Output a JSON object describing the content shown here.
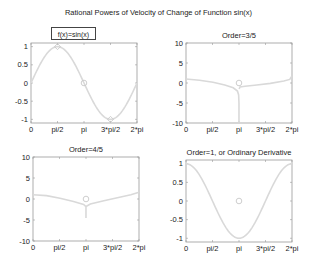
{
  "figure": {
    "title": "Rational Powers of Velocity of Change of Function sin(x)"
  },
  "colors": {
    "curve": "#d9d9d9",
    "marker": "#c8c8c8",
    "axes": "#9a9a9a",
    "text": "#222222"
  },
  "chart_data": [
    {
      "type": "line",
      "title": "f(x)=sin(x)",
      "title_style": "boxed",
      "xlabel": "",
      "ylabel": "",
      "xlim": [
        0,
        6.2832
      ],
      "ylim": [
        -1.1,
        1.1
      ],
      "xticks": [
        0,
        1.5708,
        3.1416,
        4.7124,
        6.2832
      ],
      "xticklabels": [
        "0",
        "pi/2",
        "pi",
        "3*pi/2",
        "2*pi"
      ],
      "yticks": [
        1,
        0.5,
        0,
        -0.5,
        -1
      ],
      "yticklabels": [
        "1",
        "0.5",
        "0",
        "-0.5",
        "-1"
      ],
      "grid": false,
      "series": [
        {
          "name": "sin(x)",
          "function": "sin",
          "x": [
            0,
            0.785,
            1.571,
            2.356,
            3.142,
            3.927,
            4.712,
            5.498,
            6.283
          ],
          "y": [
            0,
            0.707,
            1,
            0.707,
            0,
            -0.707,
            -1,
            -0.707,
            0
          ]
        }
      ],
      "markers": [
        {
          "x": 1.5708,
          "y": 1,
          "shape": "diamond"
        },
        {
          "x": 3.1416,
          "y": 0,
          "shape": "circle"
        },
        {
          "x": 4.7124,
          "y": -1,
          "shape": "diamond"
        }
      ]
    },
    {
      "type": "line",
      "title": "Order=3/5",
      "xlabel": "",
      "ylabel": "",
      "xlim": [
        0,
        6.2832
      ],
      "ylim": [
        -10,
        10
      ],
      "xticks": [
        0,
        1.5708,
        3.1416,
        4.7124,
        6.2832
      ],
      "xticklabels": [
        "0",
        "pi/2",
        "pi",
        "3*pi/2",
        "2*pi"
      ],
      "yticks": [
        10,
        5,
        0,
        -5,
        -10
      ],
      "yticklabels": [
        "10",
        "5",
        "0",
        "-5",
        "-10"
      ],
      "grid": false,
      "series": [
        {
          "name": "left branch",
          "x": [
            0,
            0.8,
            1.6,
            2.3,
            2.8,
            3.05,
            3.12,
            3.14,
            3.14
          ],
          "y": [
            1.0,
            0.7,
            0.2,
            -0.5,
            -1.2,
            -2.0,
            -3.0,
            -5.0,
            -10.0
          ]
        },
        {
          "name": "right branch",
          "x": [
            3.15,
            3.2,
            3.5,
            4.2,
            5.0,
            5.8,
            6.15,
            6.283
          ],
          "y": [
            -1.5,
            -1.0,
            -0.8,
            -0.5,
            -0.1,
            0.5,
            0.9,
            1.8
          ]
        }
      ],
      "markers": [
        {
          "x": 3.1416,
          "y": 0,
          "shape": "circle"
        }
      ]
    },
    {
      "type": "line",
      "title": "Order=4/5",
      "xlabel": "",
      "ylabel": "",
      "xlim": [
        0,
        6.2832
      ],
      "ylim": [
        -10,
        10
      ],
      "xticks": [
        0,
        1.5708,
        3.1416,
        4.7124,
        6.2832
      ],
      "xticklabels": [
        "0",
        "pi/2",
        "pi",
        "3*pi/2",
        "2*pi"
      ],
      "yticks": [
        10,
        5,
        0,
        -5,
        -10
      ],
      "yticklabels": [
        "10",
        "5",
        "0",
        "-5",
        "-10"
      ],
      "grid": false,
      "series": [
        {
          "name": "left branch",
          "x": [
            0,
            0.8,
            1.6,
            2.4,
            3.0,
            3.14,
            3.14
          ],
          "y": [
            1.0,
            0.8,
            0.2,
            -0.6,
            -1.3,
            -1.8,
            -4.5
          ]
        },
        {
          "name": "right branch",
          "x": [
            3.14,
            3.4,
            4.2,
            5.0,
            5.8,
            6.283
          ],
          "y": [
            -1.8,
            -1.2,
            -0.4,
            0.3,
            1.0,
            1.6
          ]
        }
      ],
      "markers": [
        {
          "x": 3.1416,
          "y": 0,
          "shape": "circle"
        }
      ]
    },
    {
      "type": "line",
      "title": "Order=1, or Ordinary Derivative",
      "xlabel": "",
      "ylabel": "",
      "xlim": [
        0,
        6.2832
      ],
      "ylim": [
        -1.1,
        1.1
      ],
      "xticks": [
        0,
        1.5708,
        3.1416,
        4.7124,
        6.2832
      ],
      "xticklabels": [
        "0",
        "pi/2",
        "pi",
        "3*pi/2",
        "2*pi"
      ],
      "yticks": [
        1,
        0.5,
        0,
        -0.5,
        -1
      ],
      "yticklabels": [
        "1",
        "0.5",
        "0",
        "-0.5",
        "-1"
      ],
      "grid": false,
      "series": [
        {
          "name": "cos(x)",
          "function": "cos",
          "x": [
            0,
            0.785,
            1.571,
            2.356,
            3.142,
            3.927,
            4.712,
            5.498,
            6.283
          ],
          "y": [
            1,
            0.707,
            0,
            -0.707,
            -1,
            -0.707,
            0,
            0.707,
            1
          ]
        }
      ],
      "markers": [
        {
          "x": 3.1416,
          "y": 0,
          "shape": "circle"
        }
      ]
    }
  ]
}
